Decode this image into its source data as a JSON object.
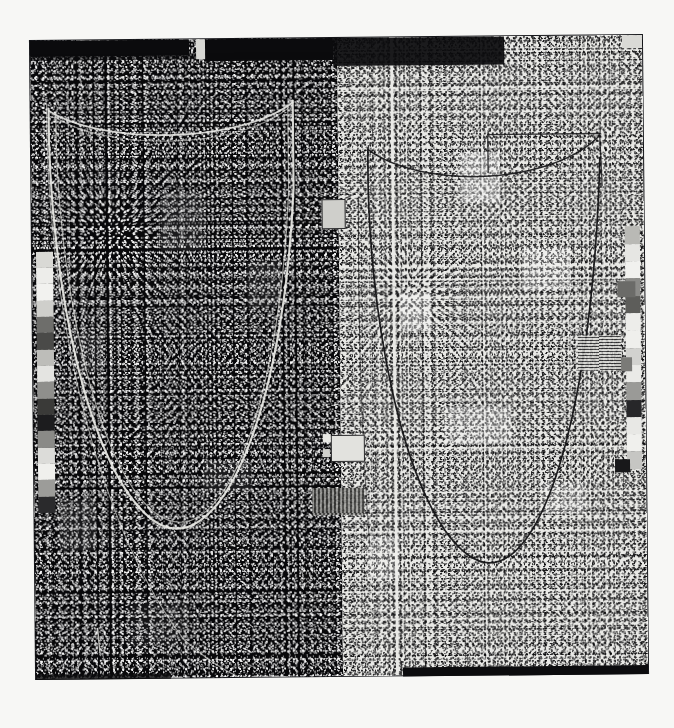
{
  "artwork": {
    "title": "Untitled Diptych — High-Contrast Halftone Scan",
    "format": "two-panel diptych, photographic print / screenprint on paper",
    "orientation": "portrait",
    "background_color": "#f7f7f5",
    "plate_border_color": "#15161a"
  },
  "panels": [
    {
      "id": "left",
      "name": "left-panel",
      "tonality": "negative",
      "ground_color": "#08080a",
      "speck_color": "#ffffff",
      "description": "Dense white speckle grain over black ground; pale drawn catenary and a crossing diagonal arc rendered as thin white lines."
    },
    {
      "id": "right",
      "name": "right-panel",
      "tonality": "positive",
      "ground_color": "#e9e9e6",
      "speck_color": "#0a0a0c",
      "description": "Dense black speckle grain over light ground; the same catenary form redrawn as thin dark lines, mirroring the left panel in reverse tone."
    }
  ],
  "top_band": {
    "name": "masking-band",
    "color": "#0b0b0d",
    "description": "Dark horizontal masking bar running across the upper edge of both panels, broken by two light gaps"
  },
  "curves": {
    "left": {
      "stroke": "#e8e8e4",
      "items": [
        {
          "name": "catenary-primary",
          "kind": "u-curve"
        },
        {
          "name": "catenary-secondary",
          "kind": "u-curve-offset"
        },
        {
          "name": "sagging-top-arc",
          "kind": "arc"
        },
        {
          "name": "diagonal-sweep",
          "kind": "diagonal"
        }
      ]
    },
    "right": {
      "stroke": "#141416",
      "items": [
        {
          "name": "catenary-primary",
          "kind": "u-curve"
        },
        {
          "name": "sagging-top-arc",
          "kind": "arc"
        },
        {
          "name": "upper-box-outline",
          "kind": "rect-fragment"
        },
        {
          "name": "left-vertical-drop",
          "kind": "vertical"
        }
      ]
    }
  },
  "left_wedge": {
    "name": "grayscale-step-wedge-left",
    "label": "left edge density step wedge",
    "steps": [
      "#d9d9d5",
      "#ededea",
      "#f2f2ef",
      "#cfcfcb",
      "#6e6e6b",
      "#4a4a48",
      "#bdbdb9",
      "#e4e4e1",
      "#8f8f8c",
      "#3a3a38",
      "#1c1c1e",
      "#8a8a87",
      "#dcdcd9",
      "#f0f0ed",
      "#9c9c99",
      "#2a2a2c"
    ]
  },
  "right_wedge": {
    "name": "grayscale-step-wedge-right",
    "label": "right edge density step wedge",
    "steps": [
      "#b9b9b5",
      "#e6e6e3",
      "#f1f1ee",
      "#8b8b88",
      "#5d5d5a",
      "#ededea",
      "#efefec",
      "#d2d2cf",
      "#eaeae7",
      "#9a9a97",
      "#272729",
      "#e8e8e5",
      "#f0f0ed",
      "#c6c6c3"
    ]
  },
  "markers": [
    {
      "name": "register-tab-upper-center",
      "color": "#d8d8d4"
    },
    {
      "name": "register-tab-mid-gutter",
      "color": "#cfcfcb"
    },
    {
      "name": "register-tab-lower-gutter",
      "color": "#e2e2de"
    },
    {
      "name": "register-tab-right-upper",
      "color": "#6b6b68"
    },
    {
      "name": "register-tab-right-mid",
      "color": "#7a7a77"
    },
    {
      "name": "register-tab-right-low",
      "color": "#18181a"
    },
    {
      "name": "corner-tab-top-right",
      "color": "#dadad6"
    },
    {
      "name": "baseline-bar-bottom-right",
      "color": "#0c0c0e"
    }
  ],
  "texture_patches": {
    "name": "density-blotches",
    "count": 12,
    "note": "soft rectangular tone patches visible through the grain on both panels"
  },
  "measurements": {
    "canvas_width_px": 674,
    "canvas_height_px": 728,
    "plate_left_px": 33,
    "plate_top_px": 38,
    "plate_width_px": 612,
    "plate_height_px": 638,
    "plate_rotation_deg": -0.55,
    "split_x_percent": 50.2
  }
}
